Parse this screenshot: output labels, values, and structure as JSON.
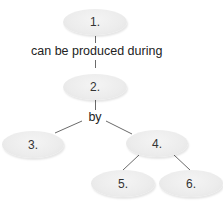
{
  "diagram": {
    "type": "concept-map",
    "nodes": [
      {
        "id": "n1",
        "label": "1."
      },
      {
        "id": "n2",
        "label": "2."
      },
      {
        "id": "n3",
        "label": "3."
      },
      {
        "id": "n4",
        "label": "4."
      },
      {
        "id": "n5",
        "label": "5."
      },
      {
        "id": "n6",
        "label": "6."
      }
    ],
    "links": [
      {
        "from": "n1",
        "to": "n2",
        "label": "can be produced during"
      },
      {
        "from": "n2",
        "to": [
          "n3",
          "n4"
        ],
        "label": "by"
      },
      {
        "from": "n4",
        "to": "n5",
        "label": ""
      },
      {
        "from": "n4",
        "to": "n6",
        "label": ""
      }
    ],
    "colors": {
      "node_fill": "#ececec",
      "line": "#666666",
      "text": "#222222"
    }
  }
}
